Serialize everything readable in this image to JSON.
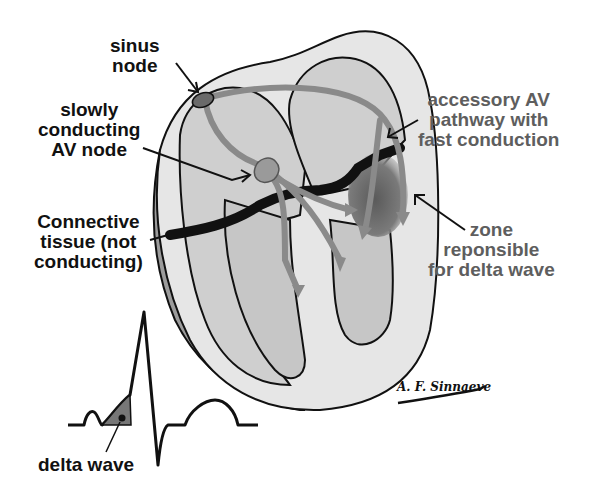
{
  "labels": {
    "sinus_node": [
      "sinus",
      "node"
    ],
    "av_node": [
      "slowly",
      "conducting",
      "AV node"
    ],
    "connective_tissue": [
      "Connective",
      "tissue (not",
      "conducting)"
    ],
    "accessory_pathway": [
      "accessory AV",
      "pathway with",
      "fast conduction"
    ],
    "delta_zone": [
      "zone",
      "reponsible",
      "for delta wave"
    ],
    "delta_wave": "delta wave"
  },
  "signature": "A. F. Sinnaeve",
  "colors": {
    "outline": "#111111",
    "myocardium_outer": "#9c9c9c",
    "myocardium_light": "#e6e6e6",
    "chamber": "#c8c8c8",
    "conduction_path": "#8a8a8a",
    "delta_zone": "#6e6e6e",
    "label_grey": "#5e5e5e",
    "label_dark": "#111111"
  }
}
